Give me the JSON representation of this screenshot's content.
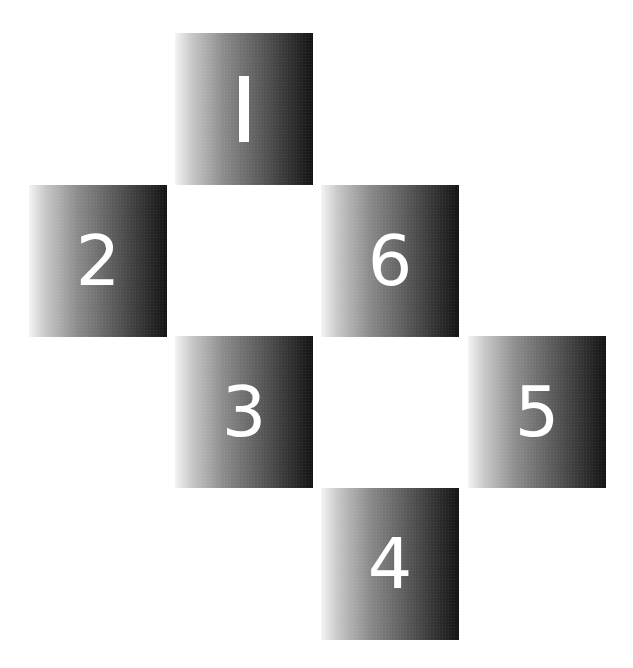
{
  "diagram": {
    "type": "numbered-tile-grid",
    "tiles": [
      {
        "label": "1",
        "col": 1,
        "row": 0
      },
      {
        "label": "2",
        "col": 0,
        "row": 1
      },
      {
        "label": "6",
        "col": 2,
        "row": 1
      },
      {
        "label": "3",
        "col": 1,
        "row": 2
      },
      {
        "label": "5",
        "col": 3,
        "row": 2
      },
      {
        "label": "4",
        "col": 2,
        "row": 3
      }
    ],
    "colors": {
      "background": "#ffffff",
      "tile_gradient_light": "#f4f4f4",
      "tile_gradient_dark": "#141414",
      "number_color": "#ffffff"
    }
  }
}
